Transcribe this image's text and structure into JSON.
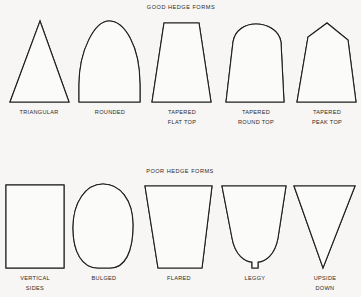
{
  "good": {
    "title": "GOOD HEDGE FORMS",
    "forms": [
      {
        "line1": "TRIANGULAR",
        "line2": ""
      },
      {
        "line1": "ROUNDED",
        "line2": ""
      },
      {
        "line1": "TAPERED",
        "line2": "FLAT TOP"
      },
      {
        "line1": "TAPERED",
        "line2": "ROUND TOP"
      },
      {
        "line1": "TAPERED",
        "line2": "PEAK TOP"
      }
    ]
  },
  "poor": {
    "title": "POOR HEDGE FORMS",
    "forms": [
      {
        "line1": "VERTICAL",
        "line2": "SIDES"
      },
      {
        "line1": "BULGED",
        "line2": ""
      },
      {
        "line1": "FLARED",
        "line2": ""
      },
      {
        "line1": "LEGGY",
        "line2": ""
      },
      {
        "line1": "UPSIDE",
        "line2": "DOWN"
      }
    ]
  }
}
